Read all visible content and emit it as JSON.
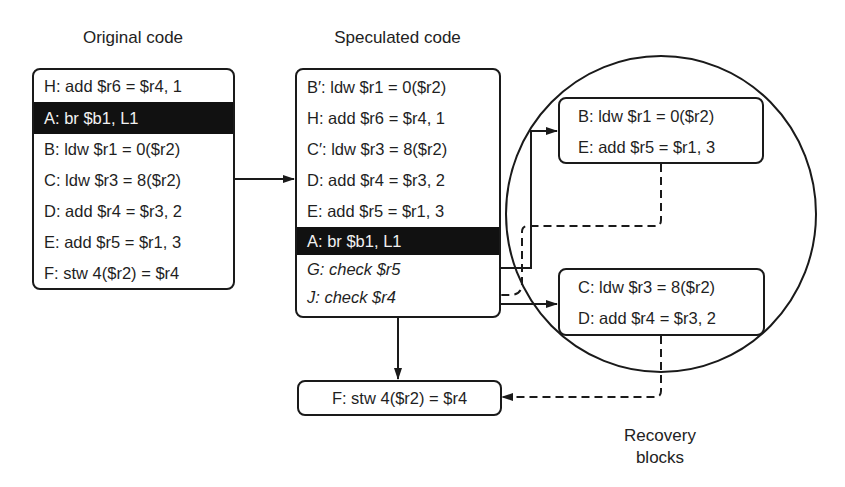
{
  "titles": {
    "original": "Original code",
    "speculated": "Speculated code",
    "recovery": [
      "Recovery",
      "blocks"
    ]
  },
  "original_code": [
    {
      "text": "H: add $r6 = $r4, 1",
      "highlight": false
    },
    {
      "text": "A: br $b1, L1",
      "highlight": true
    },
    {
      "text": "B: ldw $r1 = 0($r2)",
      "highlight": false
    },
    {
      "text": "C: ldw $r3 = 8($r2)",
      "highlight": false
    },
    {
      "text": "D: add $r4 = $r3, 2",
      "highlight": false
    },
    {
      "text": "E: add $r5 = $r1, 3",
      "highlight": false
    },
    {
      "text": "F: stw 4($r2) = $r4",
      "highlight": false
    }
  ],
  "speculated_code": [
    {
      "text": "B′: ldw $r1 = 0($r2)",
      "highlight": false,
      "italic": false
    },
    {
      "text": "H: add $r6 = $r4, 1",
      "highlight": false,
      "italic": false
    },
    {
      "text": "C′: ldw $r3 = 8($r2)",
      "highlight": false,
      "italic": false
    },
    {
      "text": "D: add $r4 = $r3, 2",
      "highlight": false,
      "italic": false
    },
    {
      "text": "E: add $r5 = $r1, 3",
      "highlight": false,
      "italic": false
    },
    {
      "text": "A: br $b1, L1",
      "highlight": true,
      "italic": false
    },
    {
      "text": "G: check $r5",
      "highlight": false,
      "italic": true
    },
    {
      "text": "J: check $r4",
      "highlight": false,
      "italic": true
    }
  ],
  "recovery_block_1": [
    {
      "text": "B: ldw $r1 = 0($r2)"
    },
    {
      "text": "E: add $r5 = $r1, 3"
    }
  ],
  "recovery_block_2": [
    {
      "text": "C: ldw $r3 = 8($r2)"
    },
    {
      "text": "D: add $r4 = $r3, 2"
    }
  ],
  "join_block": {
    "text": "F: stw 4($r2) = $r4"
  },
  "edges": [
    {
      "from": "original_code",
      "to": "speculated_code",
      "style": "solid"
    },
    {
      "from": "G: check $r5",
      "to": "recovery_block_1",
      "style": "solid"
    },
    {
      "from": "recovery_block_1",
      "to": "J: check $r4",
      "style": "dashed"
    },
    {
      "from": "J: check $r4",
      "to": "recovery_block_2",
      "style": "solid"
    },
    {
      "from": "speculated_code",
      "to": "join_block",
      "style": "solid"
    },
    {
      "from": "recovery_block_2",
      "to": "join_block",
      "style": "dashed"
    }
  ],
  "colors": {
    "ink": "#1a1a1a",
    "highlight_bg": "#111111",
    "highlight_fg": "#f2f2f2",
    "background": "#ffffff"
  }
}
